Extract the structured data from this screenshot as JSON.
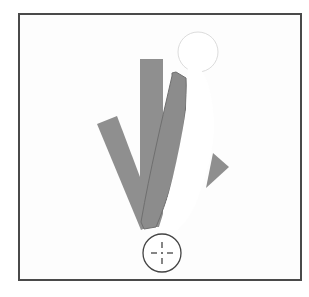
{
  "illustration": {
    "description": "Rotation illustration: bars fanning around a pivot point with a crosshair target",
    "colors": {
      "frame": "#4a4a4a",
      "background": "#fdfdfd",
      "bar_fill": "#8f8f8f",
      "bar_stroke": "#7a7a7a",
      "silhouette_outline": "#d8d8d8",
      "crosshair": "#444444"
    },
    "icons": [
      "crosshair-icon"
    ]
  }
}
